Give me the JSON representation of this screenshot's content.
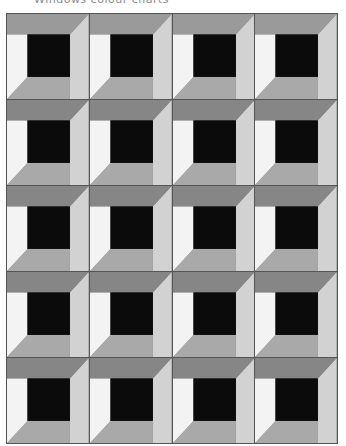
{
  "title": "Windows colour charts",
  "colors": {
    "top_band_first_row": "#9a9a9a",
    "top_band": "#868686",
    "left_band": "#f3f3f3",
    "right_band": "#d2d2d2",
    "bottom_band": "#a9a9a9",
    "center": "#0b0b0b",
    "grid_line": "#555555"
  },
  "grid": {
    "rows": 5,
    "columns": 4
  }
}
